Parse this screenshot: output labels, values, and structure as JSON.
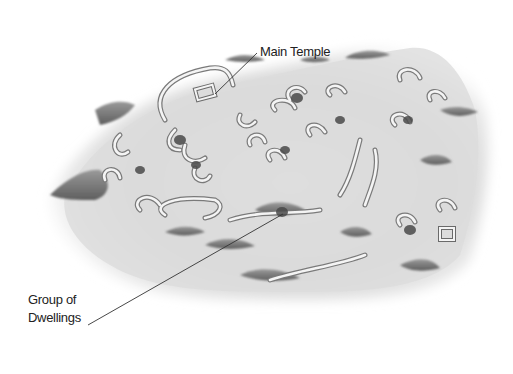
{
  "figure": {
    "type": "illustrated archaeological site map",
    "background": "#ffffff",
    "terrain_color": "#d9d9d9",
    "ruin_stroke": "#f2f2f2",
    "shadow_color": "#6e6e6e"
  },
  "labels": {
    "main_temple": "Main Temple",
    "group_of_dwellings_line1": "Group of",
    "group_of_dwellings_line2": "Dwellings"
  },
  "leaders": [
    {
      "label": "Main Temple",
      "from": [
        257,
        53
      ],
      "to": [
        215,
        94
      ]
    },
    {
      "label": "Group of Dwellings",
      "from": [
        88,
        325
      ],
      "to": [
        283,
        214
      ]
    }
  ]
}
